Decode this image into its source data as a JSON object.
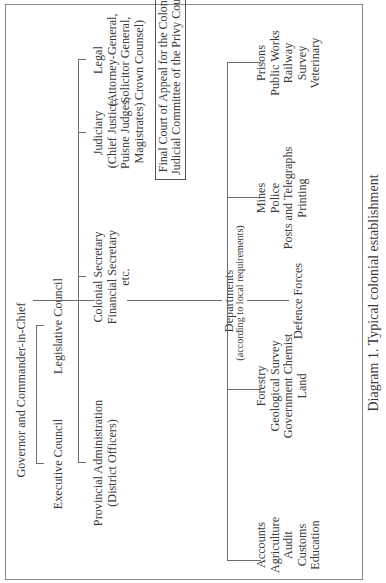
{
  "diagram": {
    "orientation": "rotated 90° counter-clockwise",
    "root": "Governor and Commander-in-Chief",
    "councils": {
      "executive": "Executive Council",
      "legislative": "Legislative Council"
    },
    "secretariat": {
      "line1": "Colonial Secretary",
      "line2": "Financial Secretary",
      "line3": "etc."
    },
    "provincial": {
      "line1": "Provincial Administration",
      "line2": "(District Officers)"
    },
    "judiciary": {
      "line1": "Judiciary",
      "line2": "(Chief Justice,",
      "line3": "Puisne Judges,",
      "line4": "Magistrates)"
    },
    "legal": {
      "line1": "Legal",
      "line2": "(Attorney-General,",
      "line3": "Solicitor General,",
      "line4": "Crown Counsel)"
    },
    "appeal": {
      "line1": "Final Court of Appeal for the Colonies:",
      "line2": "Judicial Committee of the Privy Council"
    },
    "departments": {
      "title": "Departments",
      "note": "(according to local requirements)",
      "group1": [
        "Accounts",
        "Agriculture",
        "Audit",
        "Customs",
        "Education"
      ],
      "group2": [
        "Forestry",
        "Geological Survey",
        "Government Chemist",
        "Land"
      ],
      "group3": [
        "Mines",
        "Police",
        "Posts and Telegraphs",
        "Printing"
      ],
      "group4": [
        "Prisons",
        "Public Works",
        "Railway",
        "Survey",
        "Veterinary"
      ],
      "defence": "Defence Forces"
    },
    "caption": "Diagram 1. Typical colonial establishment"
  }
}
